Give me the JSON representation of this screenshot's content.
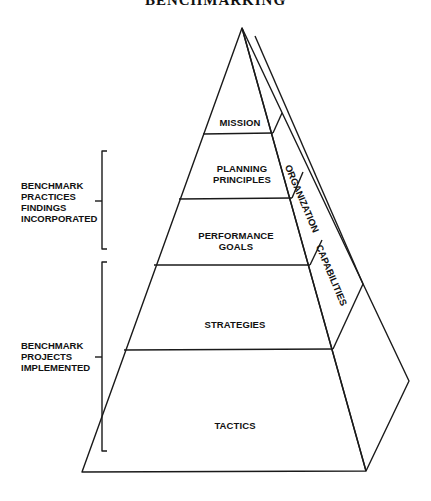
{
  "title": "BENCHMARKING",
  "pyramid": {
    "levels": [
      {
        "label": "MISSION"
      },
      {
        "label_line1": "PLANNING",
        "label_line2": "PRINCIPLES"
      },
      {
        "label_line1": "PERFORMANCE",
        "label_line2": "GOALS"
      },
      {
        "label": "STRATEGIES"
      },
      {
        "label": "TACTICS"
      }
    ],
    "side_labels": {
      "organization": "ORGANIZATION",
      "capabilities": "CAPABILITIES"
    }
  },
  "brackets": [
    {
      "lines": [
        "BENCHMARK",
        "PRACTICES",
        "FINDINGS",
        "INCORPORATED"
      ]
    },
    {
      "lines": [
        "BENCHMARK",
        "PROJECTS",
        "IMPLEMENTED"
      ]
    }
  ],
  "colors": {
    "stroke": "#1a1a1a",
    "background": "#ffffff"
  }
}
